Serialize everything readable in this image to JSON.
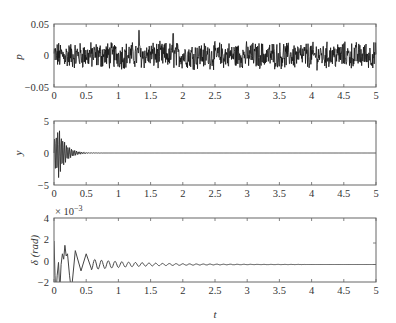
{
  "chart_data": [
    {
      "type": "line",
      "title": "",
      "xlabel": "",
      "ylabel": "p",
      "xlim": [
        0,
        5
      ],
      "ylim": [
        -0.05,
        0.05
      ],
      "xticks": [
        "0",
        "0.5",
        "1",
        "1.5",
        "2",
        "2.5",
        "3",
        "3.5",
        "4",
        "4.5",
        "5"
      ],
      "yticks": [
        "0.05",
        "0",
        "-0.05"
      ],
      "grid": false,
      "series": [
        {
          "name": "p",
          "description": "band-limited random noise, amplitude mostly within ±0.02, peaks ~0.04 near t=1.3 and t=1.85",
          "x": [
            0,
            5
          ],
          "amplitude": 0.02
        }
      ]
    },
    {
      "type": "line",
      "title": "",
      "xlabel": "",
      "ylabel": "y",
      "xlim": [
        0,
        5
      ],
      "ylim": [
        -5,
        5
      ],
      "xticks": [
        "0",
        "0.5",
        "1",
        "1.5",
        "2",
        "2.5",
        "3",
        "3.5",
        "4",
        "4.5",
        "5"
      ],
      "yticks": [
        "5",
        "0",
        "-5"
      ],
      "grid": false,
      "series": [
        {
          "name": "y",
          "description": "fast decaying oscillation, peak ~±4 near t=0.05-0.1, decays to ~0 by t=0.5",
          "x": [
            0,
            0.05,
            0.1,
            0.2,
            0.3,
            0.4,
            0.5,
            1,
            5
          ],
          "envelope": [
            2,
            3.8,
            3.5,
            1.5,
            0.6,
            0.2,
            0.05,
            0,
            0
          ]
        }
      ]
    },
    {
      "type": "line",
      "title": "",
      "xlabel": "t",
      "ylabel": "δ (rad)",
      "xlim": [
        0,
        5
      ],
      "ylim": [
        -0.002,
        0.004
      ],
      "y_multiplier": "× 10^-3",
      "xticks": [
        "0",
        "0.5",
        "1",
        "1.5",
        "2",
        "2.5",
        "3",
        "3.5",
        "4",
        "4.5",
        "5"
      ],
      "yticks": [
        "4",
        "2",
        "0",
        "-2"
      ],
      "grid": false,
      "series": [
        {
          "name": "δ",
          "description": "decaying oscillation in units of 1e-3 rad; large swings near t<0.3 (to ~2, below -2), then ~±1 at t=0.3-0.5, ~±0.3 at t=1, ~±0.1 at t=2, flat ~0 after t=2.5",
          "x": [
            0,
            0.02,
            0.1,
            0.2,
            0.3,
            0.5,
            1,
            1.5,
            2,
            2.5,
            5
          ],
          "values": [
            2.2,
            -2.5,
            -1.5,
            1.8,
            1.2,
            1.0,
            0.3,
            0.2,
            0.1,
            0,
            0
          ]
        }
      ]
    }
  ],
  "panels": [
    {
      "ylabel": "p",
      "yticks": [
        "0.05",
        "0",
        "−0.05"
      ]
    },
    {
      "ylabel": "y",
      "yticks": [
        "5",
        "0",
        "−5"
      ]
    },
    {
      "ylabel": "δ (rad)",
      "yticks": [
        "4",
        "2",
        "0",
        "−2"
      ],
      "multiplier_base": "× 10",
      "multiplier_exp": "−3"
    }
  ],
  "xticks": [
    "0",
    "0.5",
    "1",
    "1.5",
    "2",
    "2.5",
    "3",
    "3.5",
    "4",
    "4.5",
    "5"
  ],
  "xlabel": "t",
  "colors": {
    "line": "#1a1a1a",
    "line_gray": "#555555",
    "axis": "#555555"
  }
}
